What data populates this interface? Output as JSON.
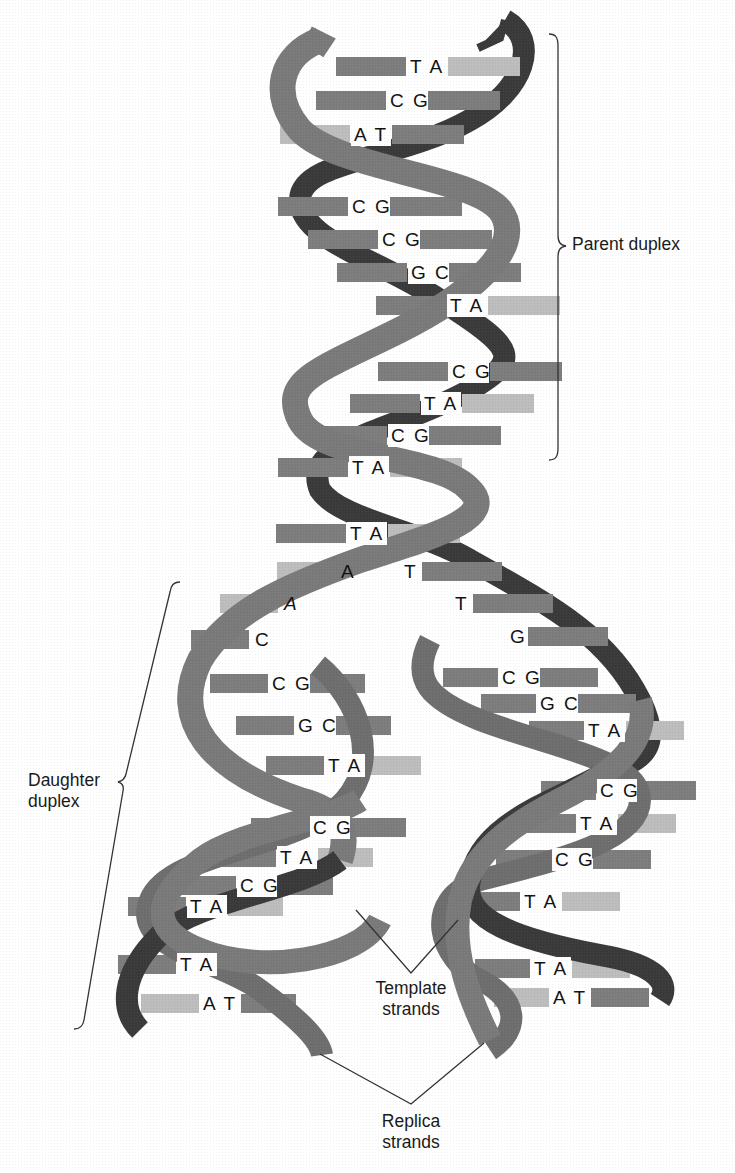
{
  "figure": {
    "colors": {
      "background": "#ffffff",
      "strand_front": "#7a7a7a",
      "strand_back": "#3a3a3a",
      "base_dark": "#7d7d7d",
      "base_light": "#bdbdbd",
      "text": "#111111",
      "lines": "#333333"
    }
  },
  "annotations": {
    "parent_duplex": "Parent duplex",
    "daughter_duplex": "Daughter\nduplex",
    "template_strands": "Template\nstrands",
    "replica_strands": "Replica\nstrands"
  },
  "parent_base_pairs": [
    {
      "label": "T A",
      "x": 410,
      "y": 73
    },
    {
      "label": "C G",
      "x": 390,
      "y": 107
    },
    {
      "label": "A T",
      "x": 354,
      "y": 141
    },
    {
      "label": "C G",
      "x": 352,
      "y": 213
    },
    {
      "label": "C G",
      "x": 382,
      "y": 246
    },
    {
      "label": "G C",
      "x": 411,
      "y": 279
    },
    {
      "label": "T A",
      "x": 450,
      "y": 312
    },
    {
      "label": "C G",
      "x": 452,
      "y": 378
    },
    {
      "label": "T A",
      "x": 424,
      "y": 410
    },
    {
      "label": "C G",
      "x": 391,
      "y": 442
    },
    {
      "label": "T A",
      "x": 352,
      "y": 474
    },
    {
      "label": "T A",
      "x": 350,
      "y": 540
    }
  ],
  "fork_bases": [
    {
      "label": "A",
      "x": 341,
      "y": 578,
      "side": "left"
    },
    {
      "label": "T",
      "x": 404,
      "y": 578,
      "side": "right"
    },
    {
      "label": "A",
      "x": 284,
      "y": 610,
      "side": "left"
    },
    {
      "label": "T",
      "x": 455,
      "y": 610,
      "side": "right"
    },
    {
      "label": "C",
      "x": 255,
      "y": 646,
      "side": "left"
    },
    {
      "label": "G",
      "x": 510,
      "y": 643,
      "side": "right"
    }
  ],
  "left_daughter_pairs": [
    {
      "label": "C G",
      "x": 272,
      "y": 690
    },
    {
      "label": "G C",
      "x": 298,
      "y": 732
    },
    {
      "label": "T A",
      "x": 328,
      "y": 772
    },
    {
      "label": "C G",
      "x": 313,
      "y": 834
    },
    {
      "label": "T A",
      "x": 280,
      "y": 864
    },
    {
      "label": "C G",
      "x": 240,
      "y": 892
    },
    {
      "label": "T A",
      "x": 190,
      "y": 913
    },
    {
      "label": "T A",
      "x": 180,
      "y": 971
    },
    {
      "label": "A T",
      "x": 203,
      "y": 1010
    }
  ],
  "right_daughter_pairs": [
    {
      "label": "C G",
      "x": 502,
      "y": 684
    },
    {
      "label": "G C",
      "x": 540,
      "y": 710
    },
    {
      "label": "T A",
      "x": 588,
      "y": 737
    },
    {
      "label": "C G",
      "x": 600,
      "y": 797
    },
    {
      "label": "T A",
      "x": 580,
      "y": 830
    },
    {
      "label": "C G",
      "x": 555,
      "y": 866
    },
    {
      "label": "T A",
      "x": 524,
      "y": 908
    },
    {
      "label": "T A",
      "x": 534,
      "y": 975
    },
    {
      "label": "A T",
      "x": 553,
      "y": 1004
    }
  ]
}
